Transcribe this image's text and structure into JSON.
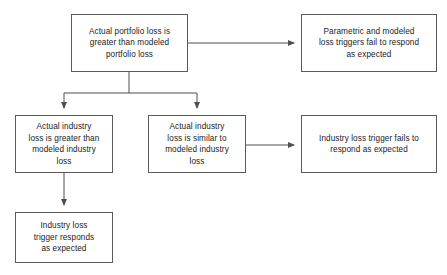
{
  "diagram": {
    "type": "flowchart",
    "background_color": "#ffffff",
    "border_color": "#5a5a5a",
    "text_color": "#1a1a1a",
    "connector_color": "#4f4f4f",
    "nodes": [
      {
        "id": "portfolio-loss-greater",
        "text": "Actual portfolio loss is\ngreater than modeled\nportfolio loss"
      },
      {
        "id": "parametric-fail",
        "text": "Parametric and modeled\nloss triggers fail to respond\nas expected"
      },
      {
        "id": "industry-loss-greater",
        "text": "Actual industry\nloss is greater than\nmodeled industry\nloss"
      },
      {
        "id": "industry-loss-similar",
        "text": "Actual industry\nloss is similar to\nmodeled industry\nloss"
      },
      {
        "id": "industry-trigger-fail",
        "text": "Industry loss trigger fails to\nrespond as expected"
      },
      {
        "id": "industry-trigger-ok",
        "text": "Industry loss\ntrigger responds\nas expected"
      }
    ],
    "edges": [
      {
        "id": "portfolio-to-parametric",
        "from": "portfolio-loss-greater",
        "to": "parametric-fail",
        "style": "horizontal-arrow"
      },
      {
        "id": "portfolio-branch-left",
        "from": "portfolio-loss-greater",
        "to": "industry-loss-greater",
        "style": "split-branch-arrow"
      },
      {
        "id": "portfolio-branch-right",
        "from": "portfolio-loss-greater",
        "to": "industry-loss-similar",
        "style": "split-branch-arrow"
      },
      {
        "id": "similar-to-trigger-fail",
        "from": "industry-loss-similar",
        "to": "industry-trigger-fail",
        "style": "horizontal-arrow"
      },
      {
        "id": "greater-to-trigger-ok",
        "from": "industry-loss-greater",
        "to": "industry-trigger-ok",
        "style": "vertical-arrow"
      }
    ]
  }
}
